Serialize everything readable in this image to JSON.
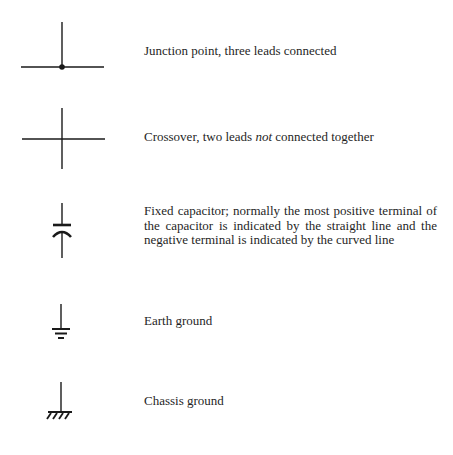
{
  "symbols": [
    {
      "id": "junction",
      "icon": "junction-point-icon",
      "description": "Junction point, three leads connected"
    },
    {
      "id": "crossover",
      "icon": "crossover-icon",
      "description_pre": "Crossover, two leads ",
      "description_emph": "not",
      "description_post": " connected together"
    },
    {
      "id": "capacitor",
      "icon": "fixed-capacitor-icon",
      "description": "Fixed capacitor; normally the most positive terminal of the capacitor is indicated by the straight line and the negative terminal is indicated by the curved line"
    },
    {
      "id": "earth-ground",
      "icon": "earth-ground-icon",
      "description": "Earth ground"
    },
    {
      "id": "chassis-ground",
      "icon": "chassis-ground-icon",
      "description": "Chassis ground"
    }
  ],
  "colors": {
    "ink": "#1a1a1a",
    "background": "#ffffff"
  }
}
